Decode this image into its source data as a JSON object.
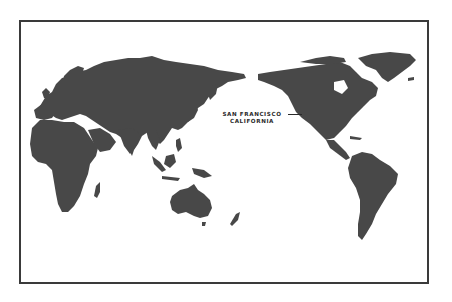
{
  "map": {
    "title": "World map centered on the Pacific",
    "projection": "Pacific-centered world map",
    "colors": {
      "land": "#484848",
      "water": "#ffffff",
      "frame": "#3a3a3a",
      "label": "#2a2a2a"
    },
    "marker": {
      "line1": "SAN FRANCISCO",
      "line2": "CALIFORNIA"
    },
    "regions": [
      "Europe",
      "Africa",
      "Asia",
      "Indonesia",
      "Australia",
      "New Zealand",
      "North America",
      "Greenland",
      "Central America",
      "South America",
      "Madagascar",
      "Japan"
    ]
  }
}
